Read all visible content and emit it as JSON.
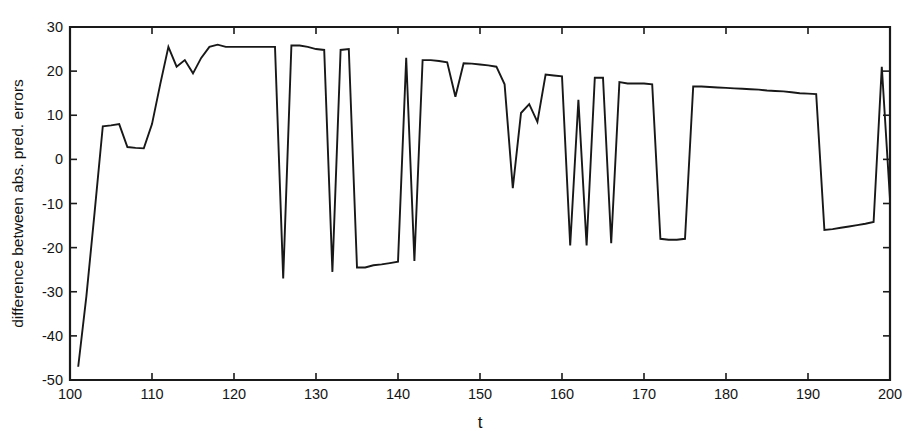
{
  "chart_data": {
    "type": "line",
    "title": "",
    "subtitle": "",
    "xlabel": "t",
    "ylabel": "difference between abs. pred. errors",
    "xlim": [
      100,
      200
    ],
    "ylim": [
      -50,
      30
    ],
    "xticks": [
      100,
      110,
      120,
      130,
      140,
      150,
      160,
      170,
      180,
      190,
      200
    ],
    "yticks": [
      -50,
      -40,
      -30,
      -20,
      -10,
      0,
      10,
      20,
      30
    ],
    "xtick_labels": [
      "100",
      "110",
      "120",
      "130",
      "140",
      "150",
      "160",
      "170",
      "180",
      "190",
      "200"
    ],
    "ytick_labels": [
      "-50",
      "-40",
      "-30",
      "-20",
      "-10",
      "0",
      "10",
      "20",
      "30"
    ],
    "grid": false,
    "legend": null,
    "line_color": "#181818",
    "series": [
      {
        "name": "difference between abs. pred. errors",
        "x": [
          101,
          102,
          103,
          104,
          105,
          106,
          107,
          108,
          109,
          110,
          111,
          112,
          113,
          114,
          115,
          116,
          117,
          118,
          119,
          120,
          121,
          122,
          123,
          124,
          125,
          126,
          127,
          128,
          129,
          130,
          131,
          132,
          133,
          134,
          135,
          136,
          137,
          138,
          139,
          140,
          141,
          142,
          143,
          144,
          145,
          146,
          147,
          148,
          149,
          150,
          151,
          152,
          153,
          154,
          155,
          156,
          157,
          158,
          159,
          160,
          161,
          162,
          163,
          164,
          165,
          166,
          167,
          168,
          169,
          170,
          171,
          172,
          173,
          174,
          175,
          176,
          177,
          178,
          179,
          180,
          181,
          182,
          183,
          184,
          185,
          186,
          187,
          188,
          189,
          190,
          191,
          192,
          193,
          194,
          195,
          196,
          197,
          198,
          199,
          200
        ],
        "y": [
          -47.0,
          -31.0,
          -12.0,
          7.5,
          7.7,
          8.0,
          2.8,
          2.6,
          2.5,
          8.0,
          17.0,
          25.5,
          21.0,
          22.5,
          19.5,
          23.0,
          25.5,
          26.0,
          25.5,
          25.5,
          25.5,
          25.5,
          25.5,
          25.5,
          25.5,
          -27.0,
          25.8,
          25.8,
          25.5,
          25.0,
          24.8,
          -25.5,
          24.8,
          25.0,
          -24.5,
          -24.5,
          -24.0,
          -23.8,
          -23.5,
          -23.2,
          23.0,
          -23.0,
          22.5,
          22.5,
          22.3,
          22.0,
          14.2,
          21.8,
          21.7,
          21.5,
          21.3,
          21.0,
          17.0,
          -6.5,
          10.5,
          12.5,
          8.5,
          19.2,
          19.0,
          18.8,
          -19.5,
          13.5,
          -19.5,
          18.5,
          18.5,
          -19.0,
          17.5,
          17.2,
          17.2,
          17.2,
          17.0,
          -18.0,
          -18.2,
          -18.2,
          -18.0,
          16.5,
          16.5,
          16.4,
          16.3,
          16.2,
          16.1,
          16.0,
          15.9,
          15.8,
          15.6,
          15.5,
          15.4,
          15.2,
          15.0,
          14.9,
          14.8,
          -16.0,
          -15.8,
          -15.5,
          -15.2,
          -14.9,
          -14.6,
          -14.2,
          21.0,
          -9.0
        ]
      }
    ]
  }
}
